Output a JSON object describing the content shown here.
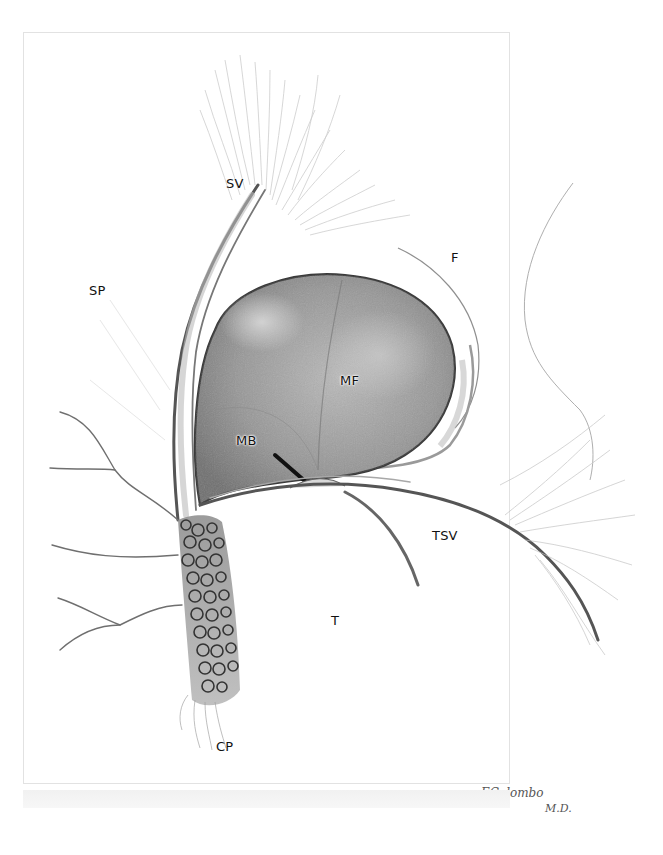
{
  "illustration": {
    "subject": "pencil anatomical drawing",
    "labels": {
      "sv": "SV",
      "sp": "SP",
      "f": "F",
      "mf": "MF",
      "mb": "MB",
      "tsv": "TSV",
      "t": "T",
      "cp": "CP"
    },
    "signature": {
      "name": "EColombo",
      "suffix": "M.D."
    }
  },
  "colors": {
    "background": "#ffffff",
    "pencil_dark": "#3a3a3a",
    "pencil_mid": "#7a7a7a",
    "pencil_light": "#bdbdbd",
    "mass_shading": "#8d8d8d"
  }
}
